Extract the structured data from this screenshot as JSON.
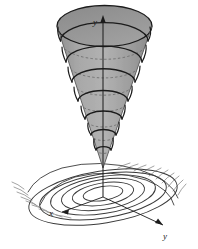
{
  "figure": {
    "title": "",
    "background_color": "#ffffff",
    "width": 198,
    "height": 249
  },
  "axes": {
    "vertical": {
      "label": "y",
      "name": "vertical-axis",
      "arrow": "up",
      "color": "#1b1b1b"
    },
    "left_horizontal": {
      "label": "x",
      "name": "x-axis",
      "arrow": "down-left",
      "color": "#1b1b1b"
    },
    "right_horizontal": {
      "label": "y",
      "name": "y-axis",
      "arrow": "down-right",
      "color": "#1b1b1b"
    }
  },
  "cone": {
    "name": "cone-surface",
    "fill_light": "#b4b4b4",
    "fill_mid": "#9c9c9c",
    "fill_dark": "#8a8a8a",
    "top_ellipse_fill": "#8d8d8d",
    "outline_color": "#1b1b1b",
    "helix_turns": 7,
    "apex_down": true
  },
  "helix": {
    "name": "cone-helix",
    "stroke_color": "#1b1b1b",
    "hidden_stroke_color": "#6d6d6d",
    "turns": 7
  },
  "ground_spiral": {
    "name": "ground-plane-spiral",
    "stroke_color": "#3a3a3a",
    "tail_stroke_color": "#8c8c8c",
    "loops": 6,
    "tail_strokes_left": 9,
    "tail_strokes_right": 10
  },
  "colors": {
    "ink": "#1b1b1b",
    "gray_mid": "#9c9c9c",
    "gray_light": "#c9c9c9",
    "background": "#ffffff"
  }
}
